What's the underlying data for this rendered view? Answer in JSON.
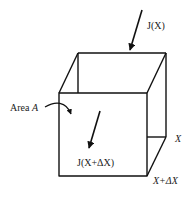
{
  "diagram": {
    "type": "flux-control-volume",
    "labels": {
      "flux_in": "J(X)",
      "flux_out": "J(X+ΔX)",
      "area_prefix": "Area ",
      "area_var": "A",
      "position_back": "X",
      "position_front": "X+ΔX"
    },
    "colors": {
      "stroke": "#111111",
      "background": "#ffffff"
    }
  }
}
